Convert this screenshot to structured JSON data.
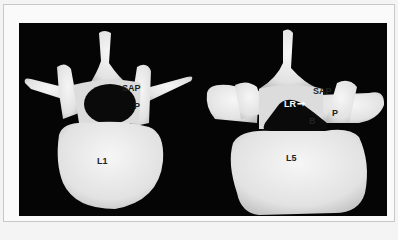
{
  "figure": {
    "left_vertebra": {
      "name": "L1",
      "labels": {
        "body": "L1",
        "sap": "SAP",
        "pedicle": "P"
      }
    },
    "right_vertebra": {
      "name": "L5",
      "labels": {
        "body": "L5",
        "sap": "SAP",
        "pedicle": "P",
        "lateral_recess": "LR",
        "b": "B"
      }
    },
    "arrow_icon": "right-arrow-icon",
    "colors": {
      "background": "#050505",
      "bone": "#ececec",
      "frame": "#fafafa"
    }
  }
}
